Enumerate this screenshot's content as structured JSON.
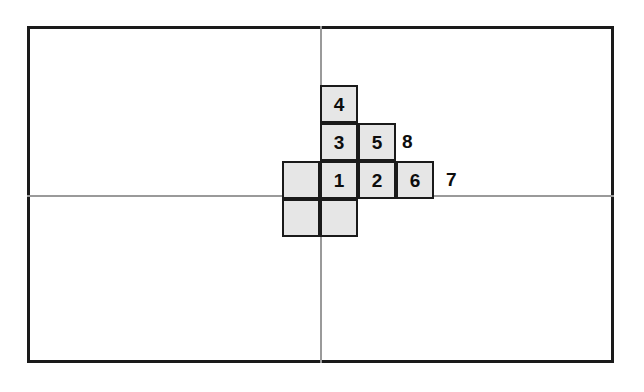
{
  "figure": {
    "colors": {
      "background": "#ffffff",
      "frame_stroke": "#1a1a1a",
      "axis_stroke": "#9a9a9a",
      "cell_fill": "#e6e6e6",
      "cell_stroke": "#1a1a1a",
      "text": "#0d0d0d"
    },
    "frame": {
      "name": "outer-rectangle",
      "x": 27,
      "y": 26,
      "width": 587,
      "height": 337
    },
    "axes": {
      "vertical": {
        "x": 320,
        "y": 26,
        "length": 337
      },
      "horizontal": {
        "x": 27,
        "y": 195,
        "length": 587
      }
    },
    "grid": {
      "cell_size": 38,
      "column_x": [
        282,
        320,
        358,
        396,
        434
      ],
      "row_y": [
        85,
        123,
        161,
        199,
        237
      ],
      "cells": [
        {
          "label": "4",
          "col": 1,
          "row": 0,
          "x": 320,
          "y": 85,
          "filled": true
        },
        {
          "label": "3",
          "col": 1,
          "row": 1,
          "x": 320,
          "y": 123,
          "filled": true
        },
        {
          "label": "5",
          "col": 2,
          "row": 1,
          "x": 358,
          "y": 123,
          "filled": true
        },
        {
          "label": "",
          "col": 0,
          "row": 2,
          "x": 282,
          "y": 161,
          "filled": true
        },
        {
          "label": "1",
          "col": 1,
          "row": 2,
          "x": 320,
          "y": 161,
          "filled": true
        },
        {
          "label": "2",
          "col": 2,
          "row": 2,
          "x": 358,
          "y": 161,
          "filled": true
        },
        {
          "label": "6",
          "col": 3,
          "row": 2,
          "x": 396,
          "y": 161,
          "filled": true
        },
        {
          "label": "",
          "col": 0,
          "row": 3,
          "x": 282,
          "y": 199,
          "filled": true
        },
        {
          "label": "",
          "col": 1,
          "row": 3,
          "x": 320,
          "y": 199,
          "filled": true
        }
      ]
    },
    "outside_labels": [
      {
        "label": "8",
        "x": 402,
        "y": 132
      },
      {
        "label": "7",
        "x": 446,
        "y": 170
      }
    ]
  }
}
